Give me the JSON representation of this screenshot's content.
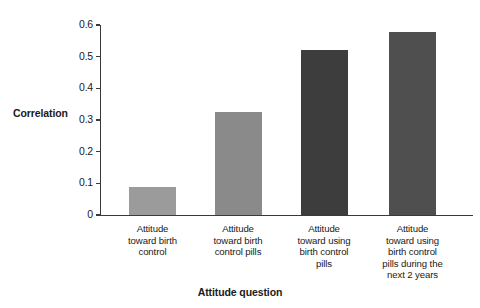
{
  "chart_data": {
    "type": "bar",
    "title": "",
    "xlabel": "Attitude question",
    "ylabel": "Correlation",
    "categories": [
      "Attitude toward birth control",
      "Attitude toward birth control pills",
      "Attitude toward using birth control pills",
      "Attitude toward using birth control pills during the next 2 years"
    ],
    "category_lines": [
      [
        "Attitude",
        "toward birth",
        "control"
      ],
      [
        "Attitude",
        "toward birth",
        "control pills"
      ],
      [
        "Attitude",
        "toward using",
        "birth control",
        "pills"
      ],
      [
        "Attitude",
        "toward using",
        "birth control",
        "pills during the",
        "next 2 years"
      ]
    ],
    "values": [
      0.088,
      0.325,
      0.522,
      0.578
    ],
    "bar_colors": [
      "#9b9b9b",
      "#8a8a8a",
      "#3d3d3d",
      "#4f4f4f"
    ],
    "ylim": [
      0,
      0.6
    ],
    "ytick_values": [
      0,
      0.1,
      0.2,
      0.3,
      0.4,
      0.5,
      0.6
    ],
    "ytick_labels": [
      "0",
      "0.1",
      "0.2",
      "0.3",
      "0.4",
      "0.5",
      "0.6"
    ],
    "grid": false,
    "legend": false,
    "legend_position": "none",
    "axis_color": "#3a3a3a",
    "background_color": "#ffffff"
  }
}
